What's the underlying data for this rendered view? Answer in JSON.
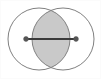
{
  "figure": {
    "canvas": {
      "width": 101,
      "height": 79,
      "background_color": "#ffffff"
    },
    "colors": {
      "circle_stroke": "#808080",
      "lens_fill": "#c9c9c9",
      "lens_stroke": "#8a8a8a",
      "segment_stroke": "#3a3a3a",
      "endpoint_fill": "#555555",
      "frame_border": "#fbfbfb"
    },
    "circles": [
      {
        "name": "left-circle",
        "cx": 39,
        "cy": 39,
        "r": 31,
        "stroke_width": 1
      },
      {
        "name": "right-circle",
        "cx": 63,
        "cy": 39,
        "r": 31,
        "stroke_width": 1
      }
    ],
    "intersection": {
      "name": "lens-region",
      "top_cusp_x": 51,
      "top_cusp_y": 10,
      "bottom_cusp_x": 51,
      "bottom_cusp_y": 68,
      "fill": "#c9c9c9"
    },
    "segment": {
      "name": "center-segment",
      "x1": 26,
      "y1": 39,
      "x2": 76,
      "y2": 39,
      "stroke_width": 2,
      "endpoint_radius": 2.4
    },
    "labels": []
  },
  "chart_data": {
    "type": "diagram",
    "shapes": [
      {
        "kind": "circle",
        "id": "left-circle",
        "cx": 39,
        "cy": 39,
        "r": 31,
        "filled": false
      },
      {
        "kind": "circle",
        "id": "right-circle",
        "cx": 63,
        "cy": 39,
        "r": 31,
        "filled": false
      },
      {
        "kind": "lens",
        "id": "intersection",
        "between": [
          "left-circle",
          "right-circle"
        ],
        "filled": true,
        "fill": "#c9c9c9"
      },
      {
        "kind": "segment",
        "id": "center-segment",
        "from": [
          26,
          39
        ],
        "to": [
          76,
          39
        ],
        "endpoints": "dots"
      }
    ],
    "xlim": [
      0,
      101
    ],
    "ylim": [
      0,
      79
    ],
    "grid": false,
    "legend": null
  }
}
